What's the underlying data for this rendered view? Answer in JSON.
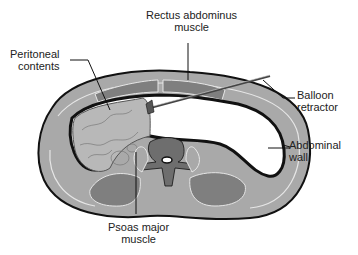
{
  "diagram": {
    "labels": {
      "rectus": {
        "line1": "Rectus abdominus",
        "line2": "muscle"
      },
      "peritoneal": {
        "line1": "Peritoneal",
        "line2": "contents"
      },
      "balloon": {
        "line1": "Balloon",
        "line2": "retractor"
      },
      "abdominal_wall": {
        "line1": "Abdominal",
        "line2": "wall"
      },
      "psoas": {
        "line1": "Psoas major",
        "line2": "muscle"
      }
    },
    "colors": {
      "outline": "#111111",
      "wall_fill": "#a9a9a9",
      "muscle_fill": "#7f7f7f",
      "highlight": "#e6e6e6",
      "organ_fill": "#b8b8b8",
      "background": "#ffffff"
    }
  }
}
